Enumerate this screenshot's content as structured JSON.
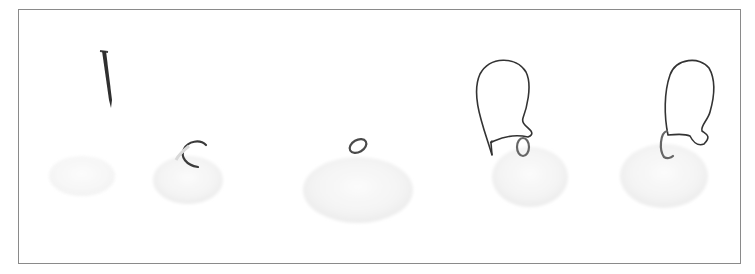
{
  "image": {
    "description": "Photograph showing five sequential steps of making shell earrings: a nail, a shell with an open jump ring, a shell with a closed jump ring, a shell with jump ring and ear wire being attached, and a finished shell earring with ear wire.",
    "colors": {
      "background": "#ffffff",
      "border": "#8a8a8a",
      "wire": "#3a3a3a",
      "shell": "#f1f1f1",
      "shell_edge": "#e6e6e6"
    },
    "steps": [
      {
        "name": "nail-and-shell",
        "label": "Step 1"
      },
      {
        "name": "shell-open-jump-ring",
        "label": "Step 2"
      },
      {
        "name": "shell-closed-jump-ring",
        "label": "Step 3"
      },
      {
        "name": "shell-with-ear-wire-attaching",
        "label": "Step 4"
      },
      {
        "name": "finished-shell-earring",
        "label": "Step 5"
      }
    ]
  }
}
